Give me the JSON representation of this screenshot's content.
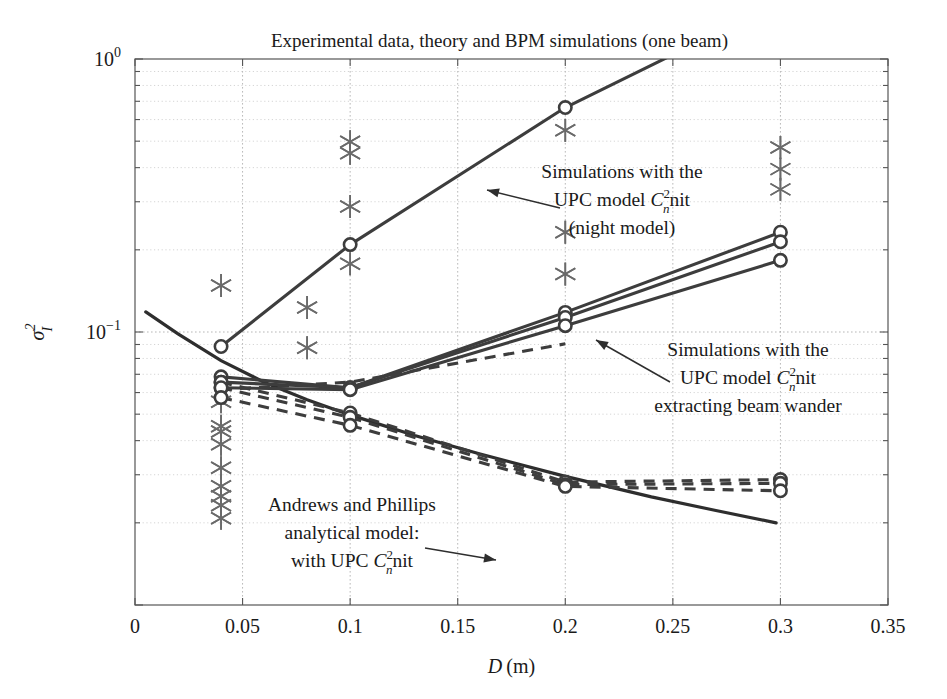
{
  "chart_data": {
    "type": "scatter",
    "title": "Experimental data, theory and BPM simulations (one beam)",
    "xlabel": "D (m)",
    "ylabel": "sigma_I^2",
    "ylabel_parts": {
      "base": "σ",
      "sup": "2",
      "sub": "I"
    },
    "xscale": "linear",
    "yscale": "log",
    "xlim": [
      0,
      0.35
    ],
    "ylim": [
      0.01,
      1
    ],
    "grid": true,
    "legend": "none",
    "xticks": [
      0,
      0.05,
      0.1,
      0.15,
      0.2,
      0.25,
      0.3,
      0.35
    ],
    "xticklabels": [
      "0",
      "0.05",
      "0.1",
      "0.15",
      "0.2",
      "0.25",
      "0.3",
      "0.35"
    ],
    "yticks": [
      1,
      0.1
    ],
    "yticklabels": [
      "10^0",
      "10^-1"
    ],
    "yticklabels_pretty": [
      {
        "mantissa": "10",
        "exponent": "0"
      },
      {
        "mantissa": "10",
        "exponent": "−1"
      }
    ],
    "series": [
      {
        "name": "Simulations with UPC model Cn2 nit (night model)",
        "style": "solid-with-circles",
        "marker": "circle",
        "x": [
          0.04,
          0.1,
          0.2,
          0.3
        ],
        "y": [
          0.0885,
          0.209,
          0.664,
          1.62
        ]
      },
      {
        "name": "Simulations UPC model Cn2 nit - upper branch",
        "style": "solid-with-circles",
        "marker": "circle",
        "x": [
          0.04,
          0.1,
          0.2,
          0.3
        ],
        "y": [
          0.0685,
          0.0625,
          0.118,
          0.232
        ]
      },
      {
        "name": "Simulations UPC model Cn2 nit - second branch",
        "style": "solid-with-circles",
        "marker": "circle",
        "x": [
          0.04,
          0.1,
          0.2,
          0.3
        ],
        "y": [
          0.0655,
          0.0625,
          0.113,
          0.214
        ]
      },
      {
        "name": "Simulations UPC model Cn2 nit - third branch",
        "style": "solid-with-circles",
        "marker": "circle",
        "x": [
          0.04,
          0.1,
          0.2,
          0.3
        ],
        "y": [
          0.0625,
          0.0615,
          0.1055,
          0.183
        ]
      },
      {
        "name": "Simulations extracting beam wander - upper dashed",
        "style": "dashed-with-circles",
        "marker": "circle",
        "x": [
          0.04,
          0.1,
          0.2,
          0.3
        ],
        "y": [
          0.0655,
          0.0505,
          0.0282,
          0.0288
        ]
      },
      {
        "name": "Simulations extracting beam wander - middle dashed",
        "style": "dashed-with-circles",
        "marker": "circle",
        "x": [
          0.04,
          0.1,
          0.2,
          0.3
        ],
        "y": [
          0.0625,
          0.0487,
          0.0276,
          0.0279
        ]
      },
      {
        "name": "Simulations extracting beam wander - lower dashed",
        "style": "dashed-with-circles",
        "marker": "circle",
        "x": [
          0.04,
          0.1,
          0.2,
          0.3
        ],
        "y": [
          0.0575,
          0.0455,
          0.0272,
          0.0262
        ]
      },
      {
        "name": "Simulations extracting beam wander - arrow branch",
        "style": "dashed-plain",
        "marker": "none",
        "x": [
          0.04,
          0.1,
          0.2
        ],
        "y": [
          0.0615,
          0.0655,
          0.0905
        ]
      }
    ],
    "theory_curve": {
      "name": "Andrews and Phillips analytical model: with UPC Cn2 nit",
      "style": "solid",
      "marker": "none",
      "x": [
        0.005,
        0.02,
        0.04,
        0.06,
        0.08,
        0.1,
        0.13,
        0.16,
        0.2,
        0.24,
        0.27,
        0.298
      ],
      "y": [
        0.1185,
        0.0985,
        0.0785,
        0.0655,
        0.0565,
        0.0497,
        0.0418,
        0.0358,
        0.0296,
        0.0249,
        0.0222,
        0.02
      ]
    },
    "experimental_points": {
      "name": "Experimental data",
      "marker": "asterisk",
      "points": [
        {
          "x": 0.04,
          "y": 0.148
        },
        {
          "x": 0.04,
          "y": 0.0555
        },
        {
          "x": 0.04,
          "y": 0.0452
        },
        {
          "x": 0.04,
          "y": 0.0432
        },
        {
          "x": 0.04,
          "y": 0.0388
        },
        {
          "x": 0.04,
          "y": 0.0318
        },
        {
          "x": 0.04,
          "y": 0.0272
        },
        {
          "x": 0.04,
          "y": 0.025
        },
        {
          "x": 0.04,
          "y": 0.0232
        },
        {
          "x": 0.04,
          "y": 0.0208
        },
        {
          "x": 0.08,
          "y": 0.123
        },
        {
          "x": 0.08,
          "y": 0.0875
        },
        {
          "x": 0.1,
          "y": 0.498
        },
        {
          "x": 0.1,
          "y": 0.452
        },
        {
          "x": 0.1,
          "y": 0.288
        },
        {
          "x": 0.1,
          "y": 0.178
        },
        {
          "x": 0.2,
          "y": 0.548
        },
        {
          "x": 0.2,
          "y": 0.232
        },
        {
          "x": 0.2,
          "y": 0.163
        },
        {
          "x": 0.3,
          "y": 0.474
        },
        {
          "x": 0.3,
          "y": 0.395
        },
        {
          "x": 0.3,
          "y": 0.333
        }
      ]
    },
    "annotations": [
      {
        "id": "annotation-night-model",
        "lines": [
          "Simulations with the",
          "UPC model C",
          "(night model)"
        ],
        "line2_prefix": "UPC model ",
        "line2_sym": "C",
        "line2_sup": "2",
        "line2_sub": "n",
        "line2_suffix": "nit",
        "text_x": 622,
        "text_y": 178,
        "arrow_from": [
          560,
          208
        ],
        "arrow_to": [
          487,
          190
        ]
      },
      {
        "id": "annotation-beam-wander",
        "lines": [
          "Simulations with the",
          "UPC model C",
          "extracting beam wander"
        ],
        "line2_prefix": "UPC model ",
        "line2_sym": "C",
        "line2_sup": "2",
        "line2_sub": "n",
        "line2_suffix": "nit",
        "text_x": 748,
        "text_y": 356,
        "arrow_from": [
          670,
          382
        ],
        "arrow_to": [
          596,
          340
        ]
      },
      {
        "id": "annotation-andrews-phillips",
        "lines": [
          "Andrews and Phillips",
          "analytical model:",
          "with UPC C"
        ],
        "line3_prefix": "with UPC ",
        "line3_sym": "C",
        "line3_sup": "2",
        "line3_sub": "n",
        "line3_suffix": "nit",
        "text_x": 352,
        "text_y": 511,
        "arrow_from": [
          425,
          548
        ],
        "arrow_to": [
          496,
          560
        ]
      }
    ],
    "colors": {
      "series_line": "#3d3d3d",
      "theory_line": "#2e2e2e",
      "marker_edge": "#3d3d3d",
      "marker_face": "#ffffff",
      "asterisk": "#6a6a6a",
      "axis": "#555555",
      "grid": "#9a9a9a",
      "text": "#1a1a1a",
      "background": "#ffffff"
    }
  }
}
